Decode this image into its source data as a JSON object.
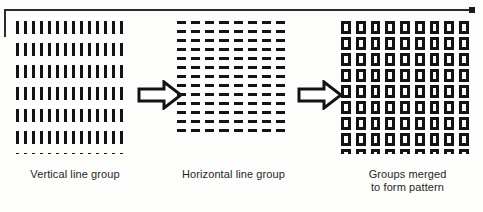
{
  "figure": {
    "background_color": "#fdfdfc",
    "ink_color": "#131313",
    "border_color": "#2b2b2b"
  },
  "panels": [
    {
      "id": "vertical",
      "element_name": "vertical line mark",
      "caption_lines": [
        "Vertical line group"
      ],
      "rows": 8,
      "columns": 14,
      "mark_orientation": "vertical"
    },
    {
      "id": "horizontal",
      "element_name": "horizontal line mark",
      "caption_lines": [
        "Horizontal line group"
      ],
      "rows": 13,
      "columns": 8,
      "mark_orientation": "horizontal"
    },
    {
      "id": "merged",
      "element_name": "square mark",
      "caption_lines": [
        "Groups merged",
        "to form pattern"
      ],
      "rows": 9,
      "columns": 9,
      "mark_orientation": "square"
    }
  ],
  "arrows": [
    {
      "id": "arrow-1",
      "direction": "right",
      "style": "hollow-block"
    },
    {
      "id": "arrow-2",
      "direction": "right",
      "style": "hollow-block"
    }
  ],
  "captions": {
    "vertical_line_1": "Vertical line group",
    "horizontal_line_1": "Horizontal line group",
    "merged_line_1": "Groups merged",
    "merged_line_2": "to form pattern"
  }
}
